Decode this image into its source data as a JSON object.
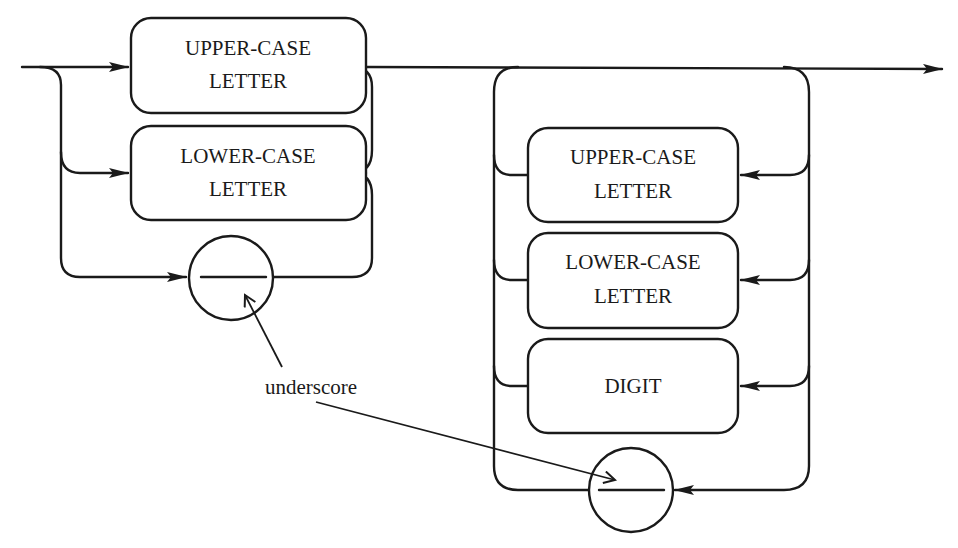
{
  "diagram": {
    "type": "syntax-diagram",
    "title": "",
    "left_alternatives": [
      {
        "kind": "box",
        "line1": "UPPER-CASE",
        "line2": "LETTER"
      },
      {
        "kind": "box",
        "line1": "LOWER-CASE",
        "line2": "LETTER"
      },
      {
        "kind": "circle",
        "symbol": "_",
        "meaning": "underscore"
      }
    ],
    "right_loop_alternatives": [
      {
        "kind": "box",
        "line1": "UPPER-CASE",
        "line2": "LETTER"
      },
      {
        "kind": "box",
        "line1": "LOWER-CASE",
        "line2": "LETTER"
      },
      {
        "kind": "box",
        "line1": "DIGIT",
        "line2": ""
      },
      {
        "kind": "circle",
        "symbol": "_",
        "meaning": "underscore"
      }
    ],
    "annotation": {
      "text": "underscore",
      "points_to": [
        "left-underscore-circle",
        "right-underscore-circle"
      ]
    },
    "colors": {
      "stroke": "#1a1a1a",
      "background": "#ffffff"
    }
  }
}
